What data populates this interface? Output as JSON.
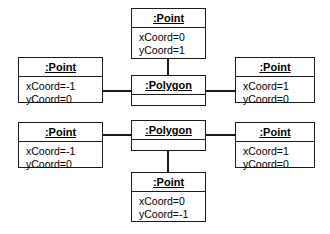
{
  "diagram": {
    "kind": "uml-object-diagram",
    "title": "",
    "stroke_color": "#1a1a1a",
    "background_color": "#ffffff",
    "objects": [
      {
        "id": "point-top",
        "name": ":Point",
        "attributes": [
          "xCoord=0",
          "yCoord=1"
        ],
        "x": 131,
        "y": 8,
        "w": 75,
        "h": 51
      },
      {
        "id": "point-left-upper",
        "name": ":Point",
        "attributes": [
          "xCoord=-1",
          "yCoord=0"
        ],
        "x": 18,
        "y": 57,
        "w": 85,
        "h": 46
      },
      {
        "id": "polygon-upper",
        "name": ":Polygon",
        "attributes": [],
        "x": 131,
        "y": 75,
        "w": 75,
        "h": 31
      },
      {
        "id": "point-right-upper",
        "name": ":Point",
        "attributes": [
          "xCoord=1",
          "yCoord=0"
        ],
        "x": 235,
        "y": 57,
        "w": 80,
        "h": 46
      },
      {
        "id": "point-left-lower",
        "name": ":Point",
        "attributes": [
          "xCoord=-1",
          "yCoord=0"
        ],
        "x": 18,
        "y": 122,
        "w": 85,
        "h": 46
      },
      {
        "id": "polygon-lower",
        "name": ":Polygon",
        "attributes": [],
        "x": 131,
        "y": 120,
        "w": 75,
        "h": 31
      },
      {
        "id": "point-right-lower",
        "name": ":Point",
        "attributes": [
          "xCoord=1",
          "yCoord=0"
        ],
        "x": 235,
        "y": 122,
        "w": 80,
        "h": 46
      },
      {
        "id": "point-bottom",
        "name": ":Point",
        "attributes": [
          "xCoord=0",
          "yCoord=-1"
        ],
        "x": 131,
        "y": 172,
        "w": 75,
        "h": 50
      }
    ],
    "links": [
      {
        "id": "link-top-polygon-upper",
        "from": "point-top",
        "to": "polygon-upper",
        "orientation": "v",
        "x": 167,
        "y": 59,
        "length": 17
      },
      {
        "id": "link-left-polygon-upper",
        "from": "point-left-upper",
        "to": "polygon-upper",
        "orientation": "h",
        "x": 102,
        "y": 90,
        "length": 30
      },
      {
        "id": "link-right-polygon-upper",
        "from": "polygon-upper",
        "to": "point-right-upper",
        "orientation": "h",
        "x": 205,
        "y": 90,
        "length": 31
      },
      {
        "id": "link-left-polygon-lower",
        "from": "point-left-lower",
        "to": "polygon-lower",
        "orientation": "h",
        "x": 102,
        "y": 134,
        "length": 30
      },
      {
        "id": "link-right-polygon-lower",
        "from": "polygon-lower",
        "to": "point-right-lower",
        "orientation": "h",
        "x": 205,
        "y": 134,
        "length": 31
      },
      {
        "id": "link-polygon-lower-bottom",
        "from": "polygon-lower",
        "to": "point-bottom",
        "orientation": "v",
        "x": 167,
        "y": 151,
        "length": 22
      }
    ]
  }
}
